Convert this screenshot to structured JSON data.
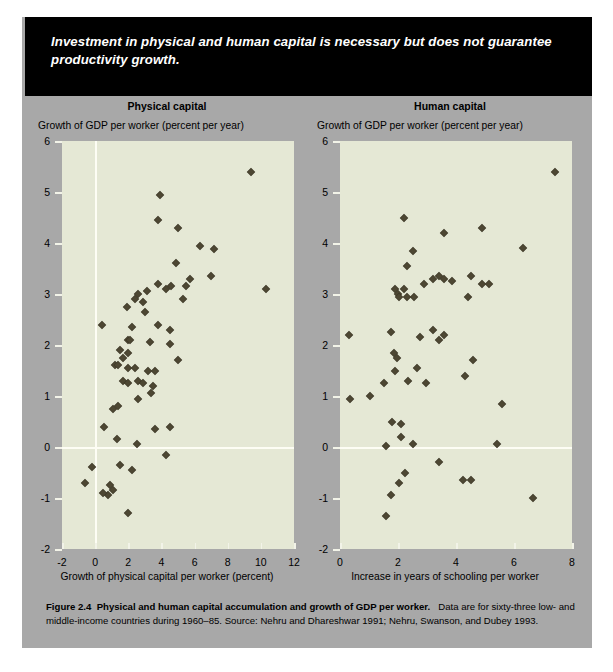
{
  "banner": {
    "text": "Investment in physical and human capital is necessary but does not guarantee productivity growth."
  },
  "colors": {
    "panel_background": "#a8a8a8",
    "plot_background": "#e5e8d5",
    "marker": "#4d4733",
    "banner_background": "#000000",
    "gridline": "#fdfdf4"
  },
  "caption": {
    "figure_label": "Figure 2.4",
    "title": "Physical and human capital accumulation and growth of GDP per worker.",
    "body": "Data are for sixty-three low- and middle-income countries during 1960–85. Source: Nehru and Dhareshwar 1991; Nehru, Swanson, and Dubey 1993."
  },
  "chart_data": [
    {
      "type": "scatter",
      "title": "Physical capital",
      "ylabel": "Growth of GDP per worker (percent per year)",
      "xlabel": "Growth of physical capital per worker (percent)",
      "xlim": [
        -2,
        12
      ],
      "ylim": [
        -2,
        6
      ],
      "xticks": [
        -2,
        0,
        2,
        4,
        6,
        8,
        10,
        12
      ],
      "yticks": [
        -2,
        -1,
        0,
        1,
        2,
        3,
        4,
        5,
        6
      ],
      "xticklabels": [
        "-2",
        "0",
        "2",
        "4",
        "6",
        "8",
        "10",
        "12"
      ],
      "yticklabels": [
        "-2",
        "-1",
        "0",
        "1",
        "2",
        "3",
        "4",
        "5",
        "6"
      ],
      "grid": false,
      "zero_lines": true,
      "points": [
        [
          9.4,
          5.4
        ],
        [
          3.9,
          4.95
        ],
        [
          3.8,
          4.45
        ],
        [
          5.0,
          4.3
        ],
        [
          6.3,
          3.95
        ],
        [
          7.2,
          3.88
        ],
        [
          4.9,
          3.6
        ],
        [
          7.0,
          3.35
        ],
        [
          5.7,
          3.3
        ],
        [
          5.5,
          3.15
        ],
        [
          4.6,
          3.15
        ],
        [
          4.3,
          3.1
        ],
        [
          3.8,
          3.2
        ],
        [
          10.3,
          3.1
        ],
        [
          3.1,
          3.05
        ],
        [
          2.6,
          3.0
        ],
        [
          2.9,
          2.85
        ],
        [
          3.0,
          2.65
        ],
        [
          2.4,
          2.9
        ],
        [
          5.3,
          2.9
        ],
        [
          1.9,
          2.75
        ],
        [
          0.4,
          2.4
        ],
        [
          3.8,
          2.4
        ],
        [
          2.2,
          2.35
        ],
        [
          4.5,
          2.3
        ],
        [
          2.0,
          2.1
        ],
        [
          2.1,
          2.1
        ],
        [
          3.3,
          2.05
        ],
        [
          4.5,
          2.02
        ],
        [
          1.5,
          1.9
        ],
        [
          2.0,
          1.85
        ],
        [
          1.7,
          1.75
        ],
        [
          5.0,
          1.7
        ],
        [
          1.2,
          1.6
        ],
        [
          1.4,
          1.6
        ],
        [
          2.0,
          1.55
        ],
        [
          2.4,
          1.55
        ],
        [
          3.2,
          1.5
        ],
        [
          3.6,
          1.5
        ],
        [
          1.7,
          1.3
        ],
        [
          2.0,
          1.25
        ],
        [
          2.6,
          1.3
        ],
        [
          2.9,
          1.25
        ],
        [
          3.5,
          1.2
        ],
        [
          3.4,
          1.05
        ],
        [
          2.6,
          0.95
        ],
        [
          1.1,
          0.75
        ],
        [
          1.4,
          0.8
        ],
        [
          0.55,
          0.4
        ],
        [
          3.6,
          0.35
        ],
        [
          4.5,
          0.4
        ],
        [
          1.3,
          0.15
        ],
        [
          2.5,
          0.05
        ],
        [
          4.3,
          -0.15
        ],
        [
          1.5,
          -0.35
        ],
        [
          -0.2,
          -0.4
        ],
        [
          2.2,
          -0.45
        ],
        [
          0.9,
          -0.75
        ],
        [
          1.1,
          -0.85
        ],
        [
          0.8,
          -0.95
        ],
        [
          -0.6,
          -0.7
        ],
        [
          0.45,
          -0.9
        ],
        [
          2.0,
          -1.3
        ]
      ]
    },
    {
      "type": "scatter",
      "title": "Human capital",
      "ylabel": "Growth of GDP per worker (percent per year)",
      "xlabel": "Increase in years of schooling per worker",
      "xlim": [
        0,
        8
      ],
      "ylim": [
        -2,
        6
      ],
      "xticks": [
        0,
        2,
        4,
        6,
        8
      ],
      "yticks": [
        -2,
        -1,
        0,
        1,
        2,
        3,
        4,
        5,
        6
      ],
      "xticklabels": [
        "0",
        "2",
        "4",
        "6",
        "8"
      ],
      "yticklabels": [
        "-2",
        "-1",
        "0",
        "1",
        "2",
        "3",
        "4",
        "5",
        "6"
      ],
      "grid": false,
      "zero_lines": true,
      "points": [
        [
          7.4,
          5.4
        ],
        [
          2.2,
          4.5
        ],
        [
          3.6,
          4.2
        ],
        [
          4.9,
          4.3
        ],
        [
          2.5,
          3.85
        ],
        [
          6.3,
          3.9
        ],
        [
          2.3,
          3.55
        ],
        [
          3.4,
          3.35
        ],
        [
          3.2,
          3.3
        ],
        [
          3.6,
          3.3
        ],
        [
          2.9,
          3.2
        ],
        [
          3.85,
          3.25
        ],
        [
          4.5,
          3.35
        ],
        [
          4.9,
          3.2
        ],
        [
          5.15,
          3.2
        ],
        [
          1.9,
          3.1
        ],
        [
          2.2,
          3.1
        ],
        [
          4.4,
          2.95
        ],
        [
          2.0,
          3.0
        ],
        [
          2.05,
          2.95
        ],
        [
          2.55,
          2.95
        ],
        [
          2.3,
          2.95
        ],
        [
          0.3,
          2.2
        ],
        [
          1.75,
          2.25
        ],
        [
          3.4,
          2.1
        ],
        [
          3.6,
          2.2
        ],
        [
          3.2,
          2.3
        ],
        [
          2.75,
          2.15
        ],
        [
          1.85,
          1.85
        ],
        [
          1.95,
          1.75
        ],
        [
          4.6,
          1.7
        ],
        [
          2.65,
          1.55
        ],
        [
          1.9,
          1.5
        ],
        [
          4.3,
          1.4
        ],
        [
          2.35,
          1.3
        ],
        [
          1.5,
          1.25
        ],
        [
          2.95,
          1.25
        ],
        [
          1.05,
          1.0
        ],
        [
          0.35,
          0.95
        ],
        [
          5.6,
          0.85
        ],
        [
          1.8,
          0.5
        ],
        [
          2.1,
          0.45
        ],
        [
          2.1,
          0.2
        ],
        [
          2.5,
          0.05
        ],
        [
          1.6,
          0.02
        ],
        [
          5.4,
          0.05
        ],
        [
          3.4,
          -0.3
        ],
        [
          2.25,
          -0.5
        ],
        [
          2.05,
          -0.7
        ],
        [
          4.25,
          -0.65
        ],
        [
          4.5,
          -0.65
        ],
        [
          1.75,
          -0.95
        ],
        [
          6.65,
          -1.0
        ],
        [
          1.6,
          -1.35
        ]
      ]
    }
  ]
}
